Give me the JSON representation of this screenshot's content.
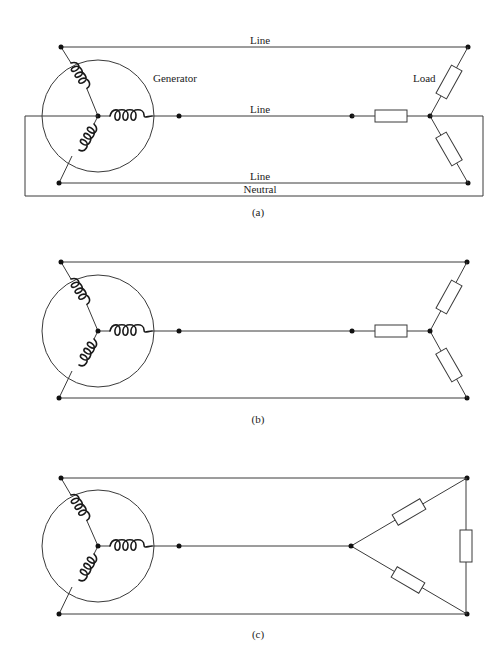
{
  "figure": {
    "panels": [
      {
        "id": "a",
        "caption": "(a)",
        "configuration": "wye-wye with neutral",
        "labels": {
          "top_line": "Line",
          "middle_line": "Line",
          "bottom_line": "Line",
          "neutral": "Neutral",
          "generator": "Generator",
          "load": "Load"
        }
      },
      {
        "id": "b",
        "caption": "(b)",
        "configuration": "wye-wye without neutral"
      },
      {
        "id": "c",
        "caption": "(c)",
        "configuration": "wye-delta"
      }
    ],
    "colors": {
      "line": "#3a3a3a",
      "coil": "#1a1a1a",
      "background": "#ffffff"
    }
  }
}
